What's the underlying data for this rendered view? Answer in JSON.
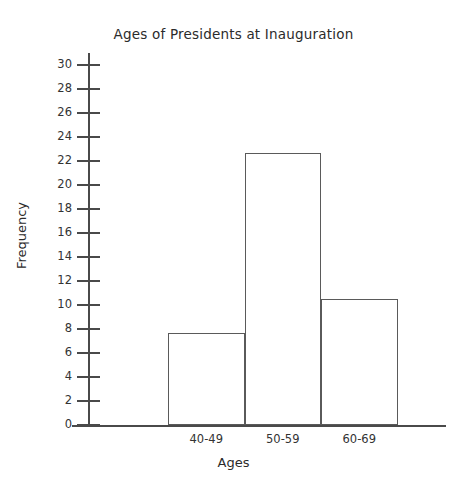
{
  "chart_data": {
    "type": "bar",
    "title": "Ages of Presidents at Inauguration",
    "xlabel": "Ages",
    "ylabel": "Frequency",
    "categories": [
      "40-49",
      "50-59",
      "60-69"
    ],
    "values": [
      7.7,
      22.7,
      10.5
    ],
    "ylim": [
      0,
      30
    ],
    "ytick_step": 2,
    "yticks": [
      0,
      2,
      4,
      6,
      8,
      10,
      12,
      14,
      16,
      18,
      20,
      22,
      24,
      26,
      28,
      30
    ],
    "ytick_labels": [
      "0",
      "2",
      "4",
      "6",
      "8",
      "10",
      "12",
      "14",
      "16",
      "18",
      "20",
      "22",
      "24",
      "26",
      "28",
      "30"
    ],
    "grid": false,
    "legend": false,
    "legend_position": "none",
    "bar_style": "histogram-adjacent-unfilled",
    "colors": {
      "background": "#ffffff",
      "bar_fill": "#ffffff",
      "bar_outline": "#5a5a5a",
      "axis": "#4a4a4a",
      "text": "#2b2b2b"
    }
  }
}
